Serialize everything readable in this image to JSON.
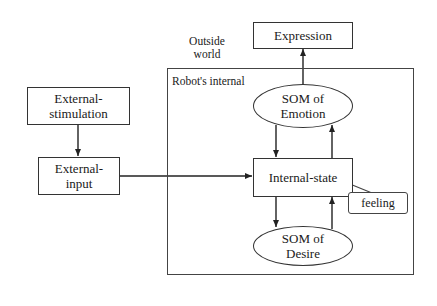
{
  "diagram": {
    "title": "",
    "outside_world_label": "Outside world",
    "outside_world_lines": [
      "Outside",
      "world"
    ],
    "robot_internal_label": "Robot's internal",
    "nodes": {
      "expression": {
        "label": "Expression",
        "shape": "rectangle"
      },
      "som_emotion": {
        "label_lines": [
          "SOM of",
          "Emotion"
        ],
        "shape": "ellipse"
      },
      "internal_state": {
        "label": "Internal-state",
        "shape": "rectangle"
      },
      "feeling": {
        "label": "feeling",
        "shape": "callout"
      },
      "som_desire": {
        "label_lines": [
          "SOM of",
          "Desire"
        ],
        "shape": "ellipse"
      },
      "external_stimulation": {
        "label_lines": [
          "External-",
          "stimulation"
        ],
        "shape": "rectangle"
      },
      "external_input": {
        "label_lines": [
          "External-",
          "input"
        ],
        "shape": "rectangle"
      }
    },
    "edges": [
      {
        "from": "External-stimulation",
        "to": "External-input"
      },
      {
        "from": "External-input",
        "to": "Internal-state"
      },
      {
        "from": "SOM of Emotion",
        "to": "Expression"
      },
      {
        "from": "SOM of Emotion",
        "to": "Internal-state"
      },
      {
        "from": "Internal-state",
        "to": "SOM of Emotion"
      },
      {
        "from": "Internal-state",
        "to": "SOM of Desire"
      },
      {
        "from": "SOM of Desire",
        "to": "Internal-state"
      }
    ],
    "colors": {
      "stroke": "#333333",
      "background": "#ffffff",
      "text": "#1a1a1a"
    }
  }
}
